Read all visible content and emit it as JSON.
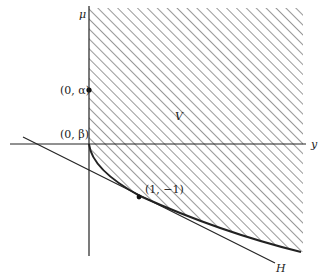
{
  "figure": {
    "axes": {
      "vertical_label": "μ",
      "horizontal_label": "y"
    },
    "points": [
      {
        "label": "(0, α)"
      },
      {
        "label": "(0, β)"
      },
      {
        "label": "(1, −1)"
      }
    ],
    "region_label": "V",
    "line_label": "H",
    "colors": {
      "stroke": "#222222",
      "hatch": "#444444",
      "background": "#ffffff"
    }
  }
}
